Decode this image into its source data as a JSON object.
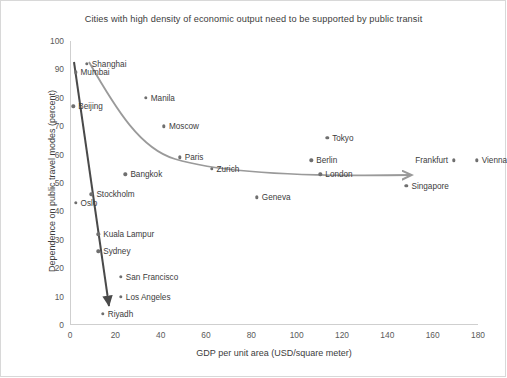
{
  "chart_data": {
    "type": "scatter",
    "title": "Cities with high density of economic output need to be supported by public transit",
    "xlabel": "GDP per unit area  (USD/square meter)",
    "ylabel": "Dependence on public travel modes (percent)",
    "xlim": [
      0,
      180
    ],
    "ylim": [
      0,
      100
    ],
    "xticks": [
      0,
      20,
      40,
      60,
      80,
      100,
      120,
      140,
      160,
      180
    ],
    "yticks": [
      0,
      10,
      20,
      30,
      40,
      50,
      60,
      70,
      80,
      90,
      100
    ],
    "grid": false,
    "legend": null,
    "marker_color": "#6f6f6f",
    "points": [
      {
        "label": "Shanghai",
        "x": 7,
        "y": 92,
        "label_side": "right"
      },
      {
        "label": "Mumbai",
        "x": 2,
        "y": 89,
        "label_side": "right"
      },
      {
        "label": "Beijing",
        "x": 1,
        "y": 77,
        "label_side": "right"
      },
      {
        "label": "Manila",
        "x": 33,
        "y": 80,
        "label_side": "right"
      },
      {
        "label": "Moscow",
        "x": 41,
        "y": 70,
        "label_side": "right"
      },
      {
        "label": "Tokyo",
        "x": 113,
        "y": 66,
        "label_side": "right"
      },
      {
        "label": "Paris",
        "x": 48,
        "y": 59,
        "label_side": "right"
      },
      {
        "label": "Berlin",
        "x": 106,
        "y": 58,
        "label_side": "right"
      },
      {
        "label": "Frankfurt",
        "x": 169,
        "y": 58,
        "label_side": "left"
      },
      {
        "label": "Vienna",
        "x": 179,
        "y": 58,
        "label_side": "right"
      },
      {
        "label": "Zurich",
        "x": 62,
        "y": 55,
        "label_side": "right"
      },
      {
        "label": "London",
        "x": 110,
        "y": 53,
        "label_side": "right"
      },
      {
        "label": "Bangkok",
        "x": 24,
        "y": 53,
        "label_side": "right"
      },
      {
        "label": "Singapore",
        "x": 148,
        "y": 49,
        "label_side": "right"
      },
      {
        "label": "Geneva",
        "x": 82,
        "y": 45,
        "label_side": "right"
      },
      {
        "label": "Stockholm",
        "x": 9,
        "y": 46,
        "label_side": "right"
      },
      {
        "label": "Oslo",
        "x": 2,
        "y": 43,
        "label_side": "right"
      },
      {
        "label": "Kuala Lampur",
        "x": 12,
        "y": 32,
        "label_side": "right"
      },
      {
        "label": "Sydney",
        "x": 12,
        "y": 26,
        "label_side": "right"
      },
      {
        "label": "San Francisco",
        "x": 22,
        "y": 17,
        "label_side": "right"
      },
      {
        "label": "Los Angeles",
        "x": 22,
        "y": 10,
        "label_side": "right"
      },
      {
        "label": "Riyadh",
        "x": 14,
        "y": 4,
        "label_side": "right"
      }
    ],
    "trend_curves": [
      {
        "name": "public-transit-trend",
        "color": "#9a9a9a",
        "arrow": true,
        "description": "Decaying curve from high-density cities toward saturation near 50 percent"
      },
      {
        "name": "car-dependence-trend",
        "color": "#4a4a4a",
        "arrow": true,
        "description": "Steep descending line through low-GDP-density cities"
      }
    ]
  },
  "axes": {
    "x_title": "GDP per unit area  (USD/square meter)",
    "y_title": "Dependence on public travel modes (percent)",
    "x_tick_labels": [
      "0",
      "20",
      "40",
      "60",
      "80",
      "100",
      "120",
      "140",
      "160",
      "180"
    ],
    "y_tick_labels": [
      "0",
      "10",
      "20",
      "30",
      "40",
      "50",
      "60",
      "70",
      "80",
      "90",
      "100"
    ]
  },
  "header": {
    "title": "Cities with high density of economic output need to be supported by public transit"
  },
  "colors": {
    "marker": "#6f6f6f",
    "gray_curve": "#9a9a9a",
    "dark_curve": "#4a4a4a",
    "axis": "#cfcfcf",
    "text": "#3c3c3c",
    "background": "#ffffff"
  }
}
